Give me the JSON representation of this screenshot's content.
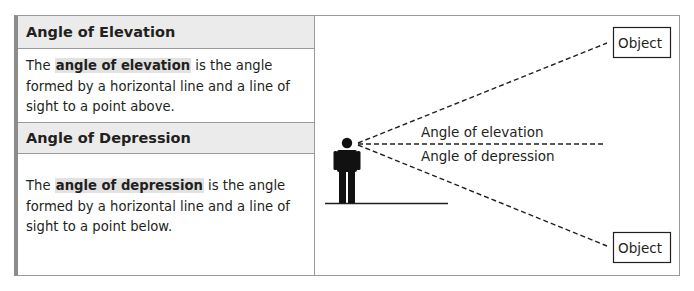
{
  "panel": {
    "elevation": {
      "heading": "Angle of Elevation",
      "text_before": "The ",
      "term": "angle of elevation",
      "text_after": " is the angle formed by a horizontal line and a line of sight to a point above."
    },
    "depression": {
      "heading": "Angle of Depression",
      "text_before": "The ",
      "term": "angle of depression",
      "text_after": " is the angle formed by a horizontal line and a line of sight to a point below."
    }
  },
  "diagram": {
    "object_top_label": "Object",
    "object_bottom_label": "Object",
    "elevation_label": "Angle of elevation",
    "depression_label": "Angle of depression",
    "line_color": "#231f20",
    "header_bg": "#ebebeb",
    "highlight_bg": "#e2e2e2"
  }
}
